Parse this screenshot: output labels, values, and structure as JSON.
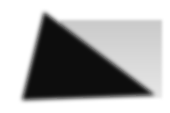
{
  "scene": {
    "description": "Blurred dark triangle over a light gray gradient rectangle",
    "colors": {
      "background": "#ffffff",
      "rectangle_top": "#c9c9c9",
      "rectangle_bottom": "#e6e6e6",
      "triangle": "#0a0a0a"
    },
    "triangle": {
      "points": "44,12 22,100 155,95"
    },
    "rectangle": {
      "x": 60,
      "y": 20,
      "width": 102,
      "height": 78
    }
  }
}
